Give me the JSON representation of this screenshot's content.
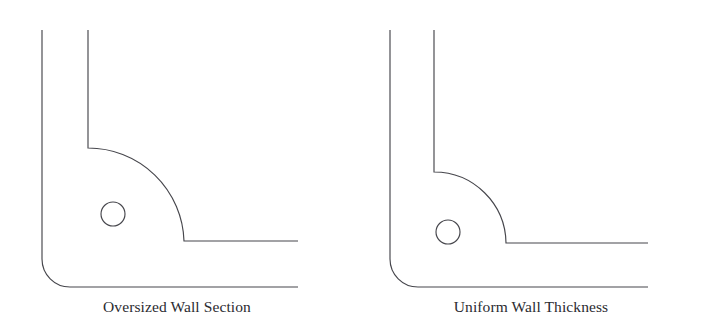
{
  "canvas": {
    "width": 708,
    "height": 335,
    "background": "#ffffff",
    "line_color": "#46464c",
    "caption_color": "#2b2b30"
  },
  "figures": [
    {
      "id": "oversized",
      "caption": "Oversized Wall Section",
      "description": "Corner wall section with an oversized inner fillet creating a thick material mass at the corner",
      "geometry": {
        "outer_wall_x": 42,
        "inner_wall_x": 88,
        "wall_top_y": 30,
        "wall_thickness": 46,
        "inner_fillet_radius": 96,
        "inner_fillet_start": [
          88,
          148
        ],
        "inner_fillet_end": [
          184,
          240
        ],
        "outer_fillet_radius": 28,
        "inner_horizontal_y": 241,
        "outer_horizontal_y": 287,
        "horizontal_end_x": 298,
        "circle_center": [
          113,
          214
        ],
        "circle_radius": 12
      }
    },
    {
      "id": "uniform",
      "caption": "Uniform Wall Thickness",
      "description": "Corner wall section with a matched inner fillet maintaining constant wall thickness around the corner",
      "geometry": {
        "outer_wall_x": 390,
        "inner_wall_x": 434,
        "wall_top_y": 30,
        "wall_thickness": 44,
        "inner_fillet_radius": 72,
        "inner_fillet_start": [
          434,
          172
        ],
        "inner_fillet_end": [
          506,
          243
        ],
        "outer_fillet_radius": 28,
        "inner_horizontal_y": 243,
        "outer_horizontal_y": 287,
        "horizontal_end_x": 648,
        "circle_center": [
          448,
          232
        ],
        "circle_radius": 12
      }
    }
  ]
}
